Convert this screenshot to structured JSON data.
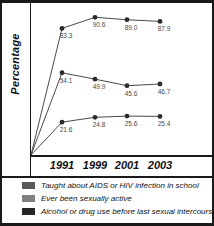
{
  "chart_data": {
    "type": "line",
    "title": "",
    "xlabel": "",
    "ylabel": "Percentage",
    "categories": [
      "1991",
      "1999",
      "2001",
      "2003"
    ],
    "xlim": [
      0,
      4
    ],
    "ylim": [
      0,
      100
    ],
    "grid": false,
    "legend_position": "bottom",
    "series": [
      {
        "name": "Taught about AIDS or HIV infection in school",
        "color": "#595959",
        "values": [
          83.3,
          90.6,
          89.0,
          87.9
        ],
        "labels": [
          "83.3",
          "90.6",
          "89.0",
          "87.9"
        ]
      },
      {
        "name": "Ever been sexually active",
        "color": "#808080",
        "values": [
          54.1,
          49.9,
          45.6,
          46.7
        ],
        "labels": [
          "54.1",
          "49.9",
          "45.6",
          "46.7"
        ]
      },
      {
        "name": "Alcohol or drug use before last sexual intercourse",
        "color": "#262626",
        "values": [
          21.6,
          24.8,
          25.6,
          25.4
        ],
        "labels": [
          "21.6",
          "24.8",
          "25.6",
          "25.4"
        ]
      }
    ]
  },
  "axis": {
    "y_title": "Percentage",
    "x_ticks": [
      "1991",
      "1999",
      "2001",
      "2003"
    ]
  },
  "legend": {
    "items": [
      {
        "label": "Taught about AIDS or HIV infection in school",
        "color": "#595959"
      },
      {
        "label": "Ever been sexually active",
        "color": "#808080"
      },
      {
        "label": "Alcohol or drug use before last sexual intercourse",
        "color": "#262626"
      }
    ]
  },
  "colors": {
    "frame": "#1a1a1a",
    "line": "#4a4a4a",
    "marker": "#2b2b2b",
    "value_label": "#4a4a4a",
    "background": "#ffffff"
  }
}
